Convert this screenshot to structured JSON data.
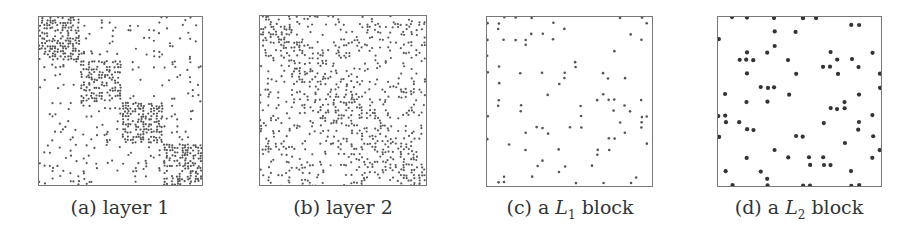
{
  "figure": {
    "panels": [
      {
        "id": "a",
        "caption_prefix": "(a) layer 1",
        "caption_var": "",
        "caption_sub": "",
        "caption_suffix": "",
        "pattern": "block4",
        "density_in": 0.55,
        "density_out": 0.06,
        "dot": 2.2,
        "color": "#555555"
      },
      {
        "id": "b",
        "caption_prefix": "(b) layer 2",
        "caption_var": "",
        "caption_sub": "",
        "caption_suffix": "",
        "pattern": "diag",
        "density_in": 0.35,
        "density_out": 0.16,
        "dot": 2.2,
        "color": "#5a5a5a"
      },
      {
        "id": "c",
        "caption_prefix": "(c) a ",
        "caption_var": "L",
        "caption_sub": "1",
        "caption_suffix": " block",
        "pattern": "sparse",
        "density_in": 0.09,
        "density_out": 0.09,
        "dot": 2.6,
        "color": "#555555"
      },
      {
        "id": "d",
        "caption_prefix": "(d) a ",
        "caption_var": "L",
        "caption_sub": "2",
        "caption_suffix": " block",
        "pattern": "sparse",
        "density_in": 0.11,
        "density_out": 0.11,
        "dot": 4.2,
        "color": "#333333"
      }
    ]
  }
}
